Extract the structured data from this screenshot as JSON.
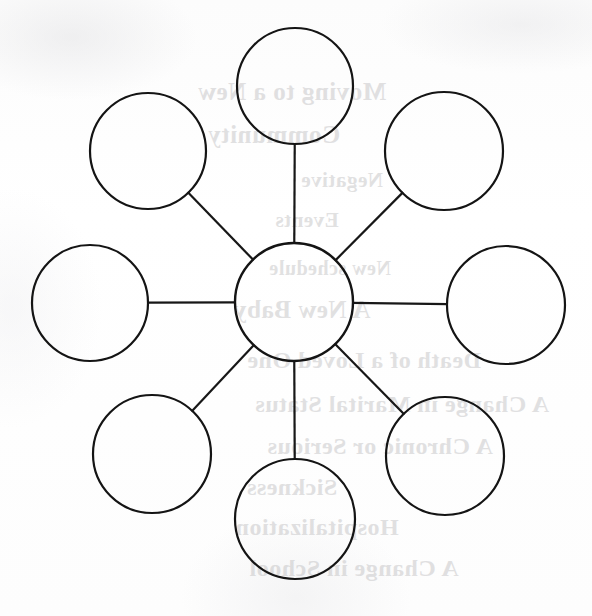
{
  "page": {
    "width": 592,
    "height": 616,
    "paper_color": "#fdfdfd",
    "ink_color": "#141414"
  },
  "diagram": {
    "type": "hub-and-spoke",
    "stroke_color": "#141414",
    "stroke_width": 2.2,
    "hub": {
      "name": "center-node",
      "label": "",
      "cx": 294,
      "cy": 302,
      "r": 59
    },
    "satellites": [
      {
        "name": "node-top",
        "label": "",
        "cx": 295,
        "cy": 86,
        "r": 58
      },
      {
        "name": "node-upper-right",
        "label": "",
        "cx": 444,
        "cy": 151,
        "r": 59
      },
      {
        "name": "node-right",
        "label": "",
        "cx": 506,
        "cy": 305,
        "r": 59
      },
      {
        "name": "node-lower-right",
        "label": "",
        "cx": 445,
        "cy": 456,
        "r": 59
      },
      {
        "name": "node-bottom",
        "label": "",
        "cx": 295,
        "cy": 519,
        "r": 60
      },
      {
        "name": "node-lower-left",
        "label": "",
        "cx": 152,
        "cy": 454,
        "r": 59
      },
      {
        "name": "node-left",
        "label": "",
        "cx": 90,
        "cy": 303,
        "r": 58
      },
      {
        "name": "node-upper-left",
        "label": "",
        "cx": 148,
        "cy": 151,
        "r": 58
      }
    ],
    "spokes": [
      {
        "name": "spoke-top",
        "from": "center-node",
        "to": "node-top"
      },
      {
        "name": "spoke-upper-right",
        "from": "center-node",
        "to": "node-upper-right"
      },
      {
        "name": "spoke-right",
        "from": "center-node",
        "to": "node-right"
      },
      {
        "name": "spoke-lower-right",
        "from": "center-node",
        "to": "node-lower-right"
      },
      {
        "name": "spoke-bottom",
        "from": "center-node",
        "to": "node-bottom"
      },
      {
        "name": "spoke-lower-left",
        "from": "center-node",
        "to": "node-lower-left"
      },
      {
        "name": "spoke-left",
        "from": "center-node",
        "to": "node-left"
      },
      {
        "name": "spoke-upper-left",
        "from": "center-node",
        "to": "node-upper-left"
      }
    ]
  },
  "bleed_through": {
    "description": "Faint mirrored text showing through from the reverse side of the page",
    "lines": [
      {
        "text": "Moving to a New",
        "x": 300,
        "y": 92,
        "size": 25
      },
      {
        "text": "Community",
        "x": 318,
        "y": 135,
        "size": 25
      },
      {
        "text": "Negative",
        "x": 250,
        "y": 180,
        "size": 21
      },
      {
        "text": "Events",
        "x": 285,
        "y": 220,
        "size": 21
      },
      {
        "text": "New schedule",
        "x": 262,
        "y": 268,
        "size": 20
      },
      {
        "text": "A New Baby",
        "x": 290,
        "y": 310,
        "size": 25
      },
      {
        "text": "Death of a Loved One",
        "x": 228,
        "y": 360,
        "size": 24
      },
      {
        "text": "A Change in Marital Status",
        "x": 190,
        "y": 404,
        "size": 24
      },
      {
        "text": "A Chronic or Serious",
        "x": 212,
        "y": 446,
        "size": 24
      },
      {
        "text": "Sickness",
        "x": 300,
        "y": 487,
        "size": 24
      },
      {
        "text": "Hospitalization",
        "x": 275,
        "y": 527,
        "size": 24
      },
      {
        "text": "A Change in School",
        "x": 238,
        "y": 568,
        "size": 24
      }
    ]
  }
}
